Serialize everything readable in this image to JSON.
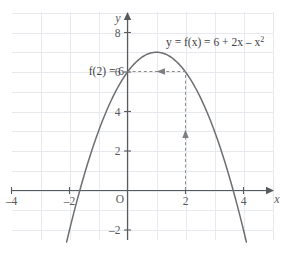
{
  "chart_data": {
    "type": "line",
    "title": "",
    "subtitle": "",
    "xlabel": "x",
    "ylabel": "y",
    "xlim": [
      -7.2,
      7.2
    ],
    "ylim": [
      -3.2,
      9.0
    ],
    "grid": true,
    "grid_step": 1,
    "legend_position": "none",
    "origin_label": "O",
    "xticks": [
      -6,
      -4,
      -2,
      2,
      4,
      6
    ],
    "xtick_labels": [
      "–6",
      "–4",
      "–2",
      "2",
      "4",
      "6"
    ],
    "yticks": [
      -2,
      2,
      4,
      6,
      8
    ],
    "ytick_labels": [
      "–2",
      "2",
      "4",
      "6",
      "8"
    ],
    "series": [
      {
        "name": "y = f(x) = 6 + 2x – x²",
        "type": "parabola",
        "color": "#6d6e70",
        "equation": "y = 6 + 2x - x^2",
        "vertex": [
          1,
          7
        ],
        "roots": [
          -1.646,
          3.646
        ],
        "y_intercept": 6,
        "x": [
          -1.9,
          -1.5,
          -1.0,
          -0.5,
          0.0,
          0.5,
          1.0,
          1.5,
          2.0,
          2.5,
          3.0,
          3.5,
          4.0,
          4.5
        ],
        "values": [
          -1.41,
          0.75,
          3.0,
          4.75,
          6.0,
          6.75,
          7.0,
          6.75,
          6.0,
          4.75,
          3.0,
          0.75,
          -2.0,
          -5.25
        ]
      }
    ],
    "annotations": [
      {
        "name": "equation-label",
        "text": "y = f(x) = 6 + 2x – x",
        "superscript": "2",
        "at": [
          2.15,
          7.85
        ]
      },
      {
        "name": "value-label",
        "text": "f(2) = 6",
        "at": [
          -2.45,
          6.0
        ]
      },
      {
        "name": "vertical-guide",
        "text": "",
        "from": [
          2,
          0
        ],
        "to": [
          2,
          6
        ],
        "style": "dashed",
        "arrow": "up"
      },
      {
        "name": "horizontal-guide",
        "text": "",
        "from": [
          2,
          6
        ],
        "to": [
          0,
          6
        ],
        "style": "dashed",
        "arrow": "left"
      }
    ]
  },
  "colors": {
    "curve": "#6d6e70",
    "axis": "#58595b",
    "grid": "#e6e9ee",
    "guide": "#8a8c8f",
    "text": "#404042",
    "background": "#ffffff"
  },
  "axes": {
    "x_axis_label": "x",
    "y_axis_label": "y",
    "origin": "O"
  }
}
